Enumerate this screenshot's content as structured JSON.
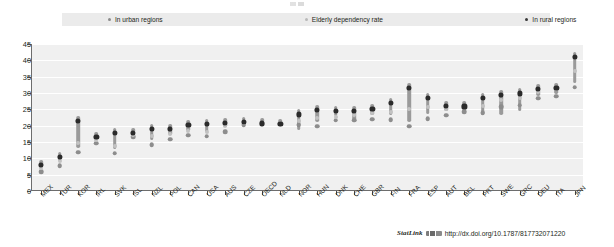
{
  "legend": {
    "items": [
      {
        "label": "In urban regions",
        "marker": "dot-icon",
        "color": "#8b8b8b"
      },
      {
        "label": "Elderly dependency rate",
        "marker": "dot-icon",
        "color": "#b9b9b9"
      },
      {
        "label": "In rural regions",
        "marker": "dot-icon",
        "color": "#3a3a3a"
      }
    ]
  },
  "source": {
    "statlink_label": "StatLink",
    "glyph": "statlink-barcode-icon",
    "url": "http://dx.doi.org/10.1787/817732071220"
  },
  "chart_data": {
    "type": "scatter",
    "title": "",
    "subtitle": "",
    "xlabel": "",
    "ylabel": "",
    "ylim": [
      0,
      45
    ],
    "ytick_step": 5,
    "ytick_labels": [
      "0",
      "5",
      "10",
      "15",
      "20",
      "25",
      "30",
      "35",
      "40",
      "45"
    ],
    "grid": true,
    "legend_position": "top",
    "categories": [
      "MEX",
      "TUR",
      "KOR",
      "IRL",
      "SVK",
      "ISL",
      "NZL",
      "POL",
      "CAN",
      "USA",
      "AUS",
      "CZE",
      "OECD",
      "NLD",
      "NOR",
      "HUN",
      "DNK",
      "CHE",
      "GBR",
      "FIN",
      "FRA",
      "ESP",
      "AUT",
      "BEL",
      "PRT",
      "SWE",
      "GRC",
      "DEU",
      "ITA",
      "JPN"
    ],
    "series": [
      {
        "name": "In urban regions",
        "color": "#8d8d8d",
        "values": [
          7.2,
          9.2,
          13.2,
          16.0,
          13.0,
          18.0,
          15.5,
          17.2,
          18.4,
          18.2,
          19.6,
          21.6,
          22.0,
          22.0,
          21.6,
          21.2,
          23.0,
          23.0,
          23.4,
          23.2,
          21.2,
          23.6,
          24.6,
          25.6,
          25.4,
          27.2,
          27.6,
          29.8,
          30.4,
          33.2
        ]
      },
      {
        "name": "Elderly dependency rate",
        "color": "#c2c2c2",
        "values": [
          8.2,
          10.4,
          16.0,
          16.8,
          15.0,
          18.4,
          18.2,
          18.6,
          19.6,
          19.4,
          21.0,
          22.0,
          22.0,
          22.0,
          22.8,
          23.6,
          24.0,
          24.6,
          25.0,
          25.4,
          26.4,
          26.8,
          26.4,
          26.6,
          27.2,
          29.0,
          29.6,
          31.4,
          32.4,
          38.0
        ]
      },
      {
        "name": "In rural regions",
        "color": "#2b2b2b",
        "values": [
          9.4,
          12.0,
          23.0,
          18.2,
          19.2,
          19.2,
          20.6,
          20.6,
          21.8,
          22.0,
          22.4,
          22.6,
          22.2,
          22.0,
          25.0,
          26.4,
          26.0,
          26.0,
          26.6,
          28.4,
          33.0,
          30.0,
          27.6,
          27.4,
          30.0,
          31.0,
          31.4,
          32.8,
          33.2,
          42.6
        ]
      }
    ],
    "ranges": [
      {
        "category": "MEX",
        "low": 7.2,
        "high": 9.4
      },
      {
        "category": "TUR",
        "low": 9.2,
        "high": 12.0
      },
      {
        "category": "KOR",
        "low": 13.2,
        "high": 23.0
      },
      {
        "category": "IRL",
        "low": 16.0,
        "high": 18.2
      },
      {
        "category": "SVK",
        "low": 13.0,
        "high": 19.2
      },
      {
        "category": "ISL",
        "low": 18.0,
        "high": 19.2
      },
      {
        "category": "NZL",
        "low": 15.5,
        "high": 20.6
      },
      {
        "category": "POL",
        "low": 17.2,
        "high": 20.6
      },
      {
        "category": "CAN",
        "low": 18.4,
        "high": 21.8
      },
      {
        "category": "USA",
        "low": 18.2,
        "high": 22.0
      },
      {
        "category": "AUS",
        "low": 19.6,
        "high": 22.4
      },
      {
        "category": "CZE",
        "low": 21.6,
        "high": 22.6
      },
      {
        "category": "OECD",
        "low": 22.0,
        "high": 22.2
      },
      {
        "category": "NLD",
        "low": 22.0,
        "high": 22.0
      },
      {
        "category": "NOR",
        "low": 18.6,
        "high": 25.0
      },
      {
        "category": "HUN",
        "low": 21.2,
        "high": 26.4
      },
      {
        "category": "DNK",
        "low": 23.0,
        "high": 26.0
      },
      {
        "category": "CHE",
        "low": 21.8,
        "high": 26.0
      },
      {
        "category": "GBR",
        "low": 23.4,
        "high": 26.6
      },
      {
        "category": "FIN",
        "low": 23.2,
        "high": 28.4
      },
      {
        "category": "FRA",
        "low": 21.2,
        "high": 33.0
      },
      {
        "category": "ESP",
        "low": 23.6,
        "high": 30.0
      },
      {
        "category": "AUT",
        "low": 24.6,
        "high": 27.6
      },
      {
        "category": "BEL",
        "low": 25.6,
        "high": 27.4
      },
      {
        "category": "PRT",
        "low": 23.4,
        "high": 30.0
      },
      {
        "category": "SWE",
        "low": 23.4,
        "high": 31.0
      },
      {
        "category": "GRC",
        "low": 24.6,
        "high": 31.4
      },
      {
        "category": "DEU",
        "low": 29.2,
        "high": 32.8
      },
      {
        "category": "ITA",
        "low": 29.6,
        "high": 33.2
      },
      {
        "category": "JPN",
        "low": 33.2,
        "high": 42.6
      }
    ]
  }
}
